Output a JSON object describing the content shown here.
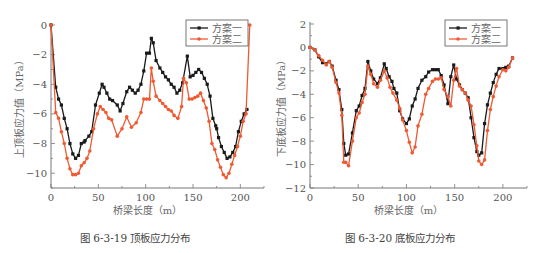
{
  "colors": {
    "scheme1": "#1a1a1a",
    "scheme2": "#ef5a32",
    "axis": "#777777"
  },
  "chart_data": [
    {
      "type": "line",
      "title": "图 6-3-19   顶板应力分布",
      "xlabel": "桥梁长度（m）",
      "ylabel": "上顶板应力值（MPa）",
      "xlim": [
        0,
        225
      ],
      "ylim": [
        -11,
        0
      ],
      "xticks": [
        0,
        50,
        100,
        150,
        200
      ],
      "yticks": [
        0,
        -2,
        -4,
        -6,
        -8,
        -10
      ],
      "grid": false,
      "legend_position": "top-right",
      "series": [
        {
          "name": "方案一",
          "x": [
            0,
            5,
            8,
            11,
            14,
            17,
            20,
            23,
            26,
            29,
            32,
            35,
            36,
            40,
            43,
            47,
            51,
            54,
            56,
            59,
            62,
            65,
            70,
            73,
            76,
            80,
            83,
            86,
            89,
            92,
            95,
            98,
            101,
            104,
            106,
            108,
            111,
            115,
            118,
            121,
            124,
            127,
            130,
            133,
            136,
            139,
            144,
            147,
            150,
            153,
            156,
            159,
            162,
            165,
            168,
            171,
            174,
            175,
            177,
            180,
            183,
            186,
            189,
            192,
            195,
            198,
            201,
            204,
            207
          ],
          "values": [
            0,
            -4.2,
            -5.0,
            -5.4,
            -6.3,
            -7.0,
            -8.0,
            -8.7,
            -9.0,
            -8.8,
            -8.0,
            -7.9,
            -7.8,
            -7.5,
            -7.2,
            -5.4,
            -4.6,
            -4.0,
            -4.2,
            -4.6,
            -5.0,
            -5.1,
            -5.4,
            -5.8,
            -5.3,
            -4.5,
            -4.2,
            -4.4,
            -4.6,
            -4.4,
            -4.0,
            -3.1,
            -1.9,
            -1.9,
            -0.9,
            -1.2,
            -2.4,
            -2.9,
            -3.2,
            -3.5,
            -3.7,
            -4.0,
            -4.2,
            -4.6,
            -4.4,
            -3.9,
            -2.1,
            -3.5,
            -3.4,
            -3.2,
            -3.0,
            -3.2,
            -3.6,
            -4.0,
            -4.8,
            -6.3,
            -6.8,
            -7.0,
            -7.6,
            -8.2,
            -8.6,
            -9.0,
            -8.9,
            -8.6,
            -8.2,
            -7.2,
            -6.5,
            -6.0,
            -5.7
          ]
        },
        {
          "name": "方案二",
          "x": [
            0,
            5,
            8,
            11,
            14,
            17,
            20,
            23,
            26,
            29,
            32,
            35,
            38,
            41,
            45,
            49,
            52,
            55,
            58,
            61,
            64,
            70,
            75,
            80,
            85,
            90,
            95,
            98,
            101,
            104,
            106,
            108,
            111,
            115,
            118,
            121,
            124,
            127,
            130,
            134,
            138,
            140,
            143,
            146,
            149,
            152,
            155,
            158,
            161,
            164,
            167,
            170,
            173,
            176,
            179,
            182,
            185,
            188,
            191,
            194,
            197,
            200,
            203,
            206,
            210
          ],
          "values": [
            0,
            -5.9,
            -6.3,
            -7.2,
            -8.0,
            -9.0,
            -9.7,
            -10.1,
            -10.1,
            -10.0,
            -9.5,
            -9.3,
            -9.0,
            -8.5,
            -7.0,
            -6.0,
            -5.5,
            -5.7,
            -5.9,
            -6.3,
            -6.4,
            -7.5,
            -7.0,
            -6.2,
            -6.9,
            -6.6,
            -5.9,
            -5.0,
            -5.0,
            -5.0,
            -2.9,
            -3.8,
            -4.8,
            -5.1,
            -5.3,
            -5.5,
            -5.7,
            -5.8,
            -6.1,
            -6.3,
            -5.5,
            -3.6,
            -3.9,
            -5.0,
            -5.0,
            -4.9,
            -4.8,
            -4.6,
            -5.1,
            -5.6,
            -6.5,
            -8.0,
            -8.4,
            -9.1,
            -9.6,
            -10.1,
            -10.3,
            -10.0,
            -9.4,
            -8.8,
            -8.2,
            -7.5,
            -6.5,
            -6.0,
            0
          ]
        }
      ]
    },
    {
      "type": "line",
      "title": "图 6-3-20   底板应力分布",
      "xlabel": "桥梁长度（m）",
      "ylabel": "下底板应力值（MPa）",
      "xlim": [
        0,
        225
      ],
      "ylim": [
        -12,
        2
      ],
      "xticks": [
        0,
        50,
        100,
        150,
        200
      ],
      "yticks": [
        2,
        0,
        -2,
        -4,
        -6,
        -8,
        -10,
        -12
      ],
      "grid": false,
      "legend_position": "top-right",
      "series": [
        {
          "name": "方案一",
          "x": [
            0,
            5,
            9,
            13,
            17,
            20,
            23,
            27,
            30,
            33,
            35,
            37,
            40,
            44,
            48,
            51,
            54,
            57,
            60,
            63,
            66,
            70,
            73,
            77,
            79,
            82,
            85,
            87,
            90,
            93,
            96,
            100,
            103,
            106,
            109,
            112,
            116,
            120,
            123,
            127,
            130,
            133,
            136,
            139,
            143,
            146,
            149,
            152,
            155,
            158,
            161,
            164,
            167,
            170,
            173,
            175,
            178,
            181,
            184,
            187,
            190,
            193,
            196,
            200,
            203,
            206,
            210
          ],
          "values": [
            0,
            -0.2,
            -0.8,
            -1.3,
            -1.4,
            -1.2,
            -1.6,
            -2.8,
            -3.6,
            -5.3,
            -8.2,
            -9.2,
            -9.1,
            -7.3,
            -5.4,
            -5.0,
            -4.1,
            -3.5,
            -1.2,
            -2.0,
            -2.7,
            -3.1,
            -2.6,
            -1.4,
            -1.8,
            -2.5,
            -2.9,
            -3.5,
            -3.9,
            -5.4,
            -6.1,
            -6.5,
            -6.1,
            -5.0,
            -4.4,
            -3.5,
            -2.8,
            -2.5,
            -2.1,
            -1.9,
            -1.9,
            -1.9,
            -2.4,
            -3.2,
            -4.8,
            -2.5,
            -1.5,
            -2.7,
            -3.2,
            -3.6,
            -3.9,
            -4.3,
            -6.0,
            -7.7,
            -8.9,
            -9.2,
            -9.0,
            -6.5,
            -4.9,
            -3.9,
            -3.0,
            -2.3,
            -1.8,
            -1.8,
            -1.7,
            -1.6,
            -0.9
          ]
        },
        {
          "name": "方案二",
          "x": [
            0,
            5,
            9,
            13,
            17,
            20,
            23,
            27,
            30,
            33,
            35,
            37,
            40,
            44,
            48,
            51,
            54,
            57,
            60,
            63,
            66,
            70,
            73,
            77,
            80,
            83,
            86,
            90,
            93,
            96,
            100,
            103,
            106,
            109,
            112,
            116,
            120,
            123,
            127,
            130,
            133,
            136,
            139,
            143,
            146,
            149,
            152,
            155,
            158,
            161,
            164,
            167,
            170,
            173,
            175,
            178,
            181,
            184,
            187,
            190,
            193,
            196,
            200,
            203,
            206,
            210
          ],
          "values": [
            0,
            -0.2,
            -0.7,
            -1.1,
            -1.5,
            -1.2,
            -1.7,
            -3.0,
            -3.9,
            -5.8,
            -9.8,
            -9.8,
            -10.1,
            -8.0,
            -6.0,
            -5.6,
            -4.7,
            -4.0,
            -1.6,
            -2.3,
            -3.1,
            -3.4,
            -2.8,
            -2.0,
            -2.6,
            -3.4,
            -3.9,
            -4.5,
            -5.2,
            -6.2,
            -7.1,
            -8.1,
            -9.0,
            -8.5,
            -6.7,
            -5.7,
            -4.0,
            -3.5,
            -2.9,
            -2.7,
            -2.7,
            -2.6,
            -3.6,
            -4.2,
            -5.0,
            -2.8,
            -1.8,
            -3.3,
            -3.6,
            -3.9,
            -4.5,
            -5.0,
            -6.6,
            -8.4,
            -9.7,
            -10.0,
            -9.6,
            -7.1,
            -5.3,
            -4.2,
            -3.3,
            -2.5,
            -1.9,
            -2.0,
            -1.7,
            -0.9
          ]
        }
      ]
    }
  ],
  "charts": [
    {
      "legend": [
        "方案一",
        "方案二"
      ],
      "xlabel": "桥梁长度（m）",
      "ylabel": "上顶板应力值（MPa）",
      "caption": "图 6-3-19   顶板应力分布"
    },
    {
      "legend": [
        "方案一",
        "方案二"
      ],
      "xlabel": "桥梁长度（m）",
      "ylabel": "下底板应力值（MPa）",
      "caption": "图 6-3-20   底板应力分布"
    }
  ]
}
